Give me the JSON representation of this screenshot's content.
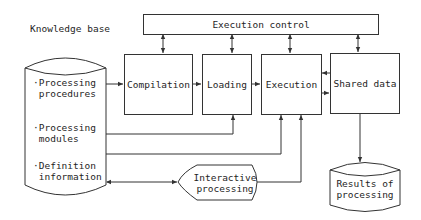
{
  "title": "Knowledge base",
  "nodes": {
    "execution_control": "Execution control",
    "compilation": "Compilation",
    "loading": "Loading",
    "execution": "Execution",
    "shared_data": "Shared data",
    "interactive_processing": [
      "Interactive",
      "processing"
    ],
    "results": [
      "Results of",
      "processing"
    ]
  },
  "knowledge_base_items": [
    {
      "bullet": "·",
      "lines": [
        "Processing",
        "procedures"
      ]
    },
    {
      "bullet": "·",
      "lines": [
        "Processing",
        "modules"
      ]
    },
    {
      "bullet": "·",
      "lines": [
        "Definition",
        "information"
      ]
    }
  ],
  "edges": [
    {
      "from": "Execution control",
      "to": "Compilation",
      "type": "bidirectional"
    },
    {
      "from": "Execution control",
      "to": "Loading",
      "type": "bidirectional"
    },
    {
      "from": "Execution control",
      "to": "Execution",
      "type": "bidirectional"
    },
    {
      "from": "Execution control",
      "to": "Shared data",
      "type": "bidirectional"
    },
    {
      "from": "Processing procedures",
      "to": "Compilation",
      "type": "directed"
    },
    {
      "from": "Compilation",
      "to": "Loading",
      "type": "directed"
    },
    {
      "from": "Loading",
      "to": "Execution",
      "type": "directed"
    },
    {
      "from": "Execution",
      "to": "Shared data",
      "type": "directed"
    },
    {
      "from": "Shared data",
      "to": "Execution",
      "type": "directed"
    },
    {
      "from": "Processing modules",
      "to": "Loading",
      "type": "directed"
    },
    {
      "from": "Definition information",
      "to": "Execution",
      "type": "directed"
    },
    {
      "from": "Definition information",
      "to": "Interactive processing",
      "type": "bidirectional"
    },
    {
      "from": "Interactive processing",
      "to": "Execution",
      "type": "directed"
    },
    {
      "from": "Shared data",
      "to": "Results of processing",
      "type": "directed"
    }
  ],
  "colors": {
    "line": "#333333",
    "background": "#ffffff"
  }
}
